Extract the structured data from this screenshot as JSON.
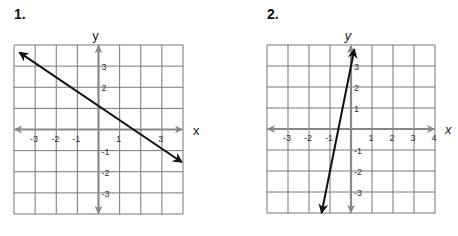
{
  "chart_data": [
    {
      "type": "line",
      "title": "1.",
      "xlabel": "x",
      "ylabel": "y",
      "xlim": [
        -4,
        4
      ],
      "ylim": [
        -4,
        4
      ],
      "grid": true,
      "x_ticks": [
        "-3",
        "-2",
        "-1",
        "1",
        "3"
      ],
      "y_ticks": [
        "3",
        "2",
        "-1",
        "-2",
        "-3"
      ],
      "series": [
        {
          "name": "line",
          "equation": "y = -3/4 x + 1",
          "slope": -0.75,
          "intercept": 1,
          "arrows": "both",
          "x": [
            -4,
            4
          ],
          "y": [
            4,
            -2
          ]
        }
      ]
    },
    {
      "type": "line",
      "title": "2.",
      "xlabel": "x",
      "ylabel": "y",
      "xlim": [
        -4,
        4
      ],
      "ylim": [
        -4,
        4
      ],
      "grid": true,
      "x_ticks": [
        "-3",
        "-2",
        "-1",
        "1",
        "2",
        "3",
        "4"
      ],
      "y_ticks": [
        "3",
        "2",
        "1",
        "-1",
        "-2",
        "-3"
      ],
      "series": [
        {
          "name": "line",
          "equation": "y = 5x + 3",
          "slope": 5,
          "intercept": 3,
          "arrows": "both",
          "x": [
            -1.4,
            0.16
          ],
          "y": [
            -4,
            3.8
          ]
        }
      ]
    }
  ],
  "graphs": [
    {
      "label": "1.",
      "xlabel": "x",
      "ylabel": "y"
    },
    {
      "label": "2.",
      "xlabel": "x",
      "ylabel": "y"
    }
  ]
}
